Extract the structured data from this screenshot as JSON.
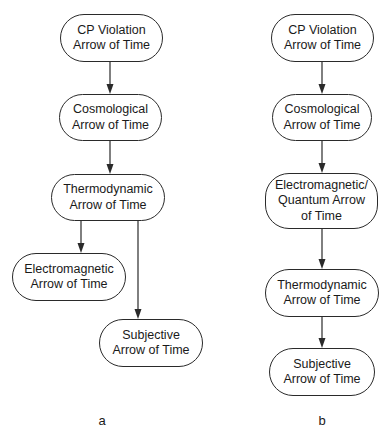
{
  "diagram_a": {
    "label": "a",
    "nodes": [
      {
        "id": "cp",
        "lines": [
          "CP Violation",
          "Arrow of Time"
        ],
        "box": [
          60,
          14,
          103,
          48
        ]
      },
      {
        "id": "cosmo",
        "lines": [
          "Cosmological",
          "Arrow of Time"
        ],
        "box": [
          59,
          94,
          103,
          47
        ]
      },
      {
        "id": "thermo",
        "lines": [
          "Thermodynamic",
          "Arrow of Time"
        ],
        "box": [
          51,
          174,
          114,
          47
        ]
      },
      {
        "id": "em",
        "lines": [
          "Electromagnetic",
          "Arrow of Time"
        ],
        "box": [
          12,
          253,
          114,
          48
        ]
      },
      {
        "id": "subj",
        "lines": [
          "Subjective",
          "Arrow of Time"
        ],
        "box": [
          99,
          319,
          104,
          48
        ]
      }
    ],
    "edges": [
      {
        "from": "cp",
        "to": "cosmo",
        "x": 110,
        "y1": 62,
        "y2": 94
      },
      {
        "from": "cosmo",
        "to": "thermo",
        "x": 110,
        "y1": 141,
        "y2": 174
      },
      {
        "from": "thermo",
        "to": "em",
        "x": 81,
        "y1": 221,
        "y2": 253
      },
      {
        "from": "thermo",
        "to": "subj",
        "x": 138,
        "y1": 221,
        "y2": 319
      }
    ],
    "label_pos": [
      102,
      413
    ]
  },
  "diagram_b": {
    "label": "b",
    "nodes": [
      {
        "id": "cp",
        "lines": [
          "CP Violation",
          "Arrow of Time"
        ],
        "box": [
          271,
          14,
          103,
          48
        ]
      },
      {
        "id": "cosmo",
        "lines": [
          "Cosmological",
          "Arrow of Time"
        ],
        "box": [
          272,
          94,
          100,
          47
        ]
      },
      {
        "id": "emq",
        "lines": [
          "Electromagnetic/",
          "Quantum Arrow",
          "of Time"
        ],
        "box": [
          265,
          173,
          113,
          56
        ]
      },
      {
        "id": "thermo",
        "lines": [
          "Thermodynamic",
          "Arrow of Time"
        ],
        "box": [
          265,
          269,
          114,
          48
        ]
      },
      {
        "id": "subj",
        "lines": [
          "Subjective",
          "Arrow of Time"
        ],
        "box": [
          269,
          348,
          106,
          48
        ]
      }
    ],
    "edges": [
      {
        "from": "cp",
        "to": "cosmo",
        "x": 322,
        "y1": 62,
        "y2": 94
      },
      {
        "from": "cosmo",
        "to": "emq",
        "x": 322,
        "y1": 141,
        "y2": 173
      },
      {
        "from": "emq",
        "to": "thermo",
        "x": 322,
        "y1": 229,
        "y2": 269
      },
      {
        "from": "thermo",
        "to": "subj",
        "x": 322,
        "y1": 317,
        "y2": 348
      }
    ],
    "label_pos": [
      322,
      413
    ]
  },
  "colors": {
    "stroke": "#2a2a2a",
    "text": "#1a1a1a",
    "background": "#ffffff"
  }
}
